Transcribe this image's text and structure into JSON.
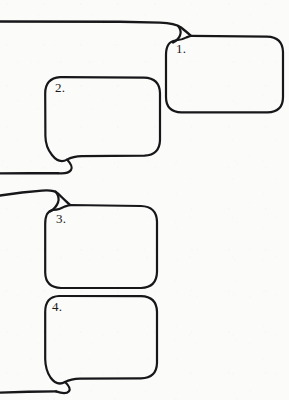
{
  "page": {
    "kind": "comic-speech-balloon-worksheet",
    "background_color": "#fbfbfa",
    "ink_color": "#17171a",
    "width": 289,
    "height": 400
  },
  "balloons": [
    {
      "id": "balloon-1",
      "label": "1.",
      "tail_direction": "up-left",
      "box": {
        "x": 166,
        "y": 38,
        "w": 117,
        "h": 75
      },
      "corner_radius": 16
    },
    {
      "id": "balloon-2",
      "label": "2.",
      "tail_direction": "down-left",
      "box": {
        "x": 45,
        "y": 77,
        "w": 115,
        "h": 79
      },
      "corner_radius": 16
    },
    {
      "id": "balloon-3",
      "label": "3.",
      "tail_direction": "up-left",
      "box": {
        "x": 45,
        "y": 208,
        "w": 112,
        "h": 80
      },
      "corner_radius": 16
    },
    {
      "id": "balloon-4",
      "label": "4.",
      "tail_direction": "down-left",
      "box": {
        "x": 45,
        "y": 296,
        "w": 112,
        "h": 82
      },
      "corner_radius": 16
    }
  ],
  "guide_lines": [
    {
      "id": "guide-line-top",
      "y": 22,
      "from_x": 0,
      "to_x": 178,
      "attached_to": "balloon-1"
    },
    {
      "id": "guide-line-second",
      "y": 173,
      "from_x": 0,
      "to_x": 60,
      "attached_to": "balloon-2"
    },
    {
      "id": "guide-line-third",
      "y": 192,
      "from_x": 0,
      "to_x": 55,
      "attached_to": "balloon-3"
    },
    {
      "id": "guide-line-bottom",
      "y": 391,
      "from_x": 0,
      "to_x": 60,
      "attached_to": "balloon-4"
    }
  ]
}
